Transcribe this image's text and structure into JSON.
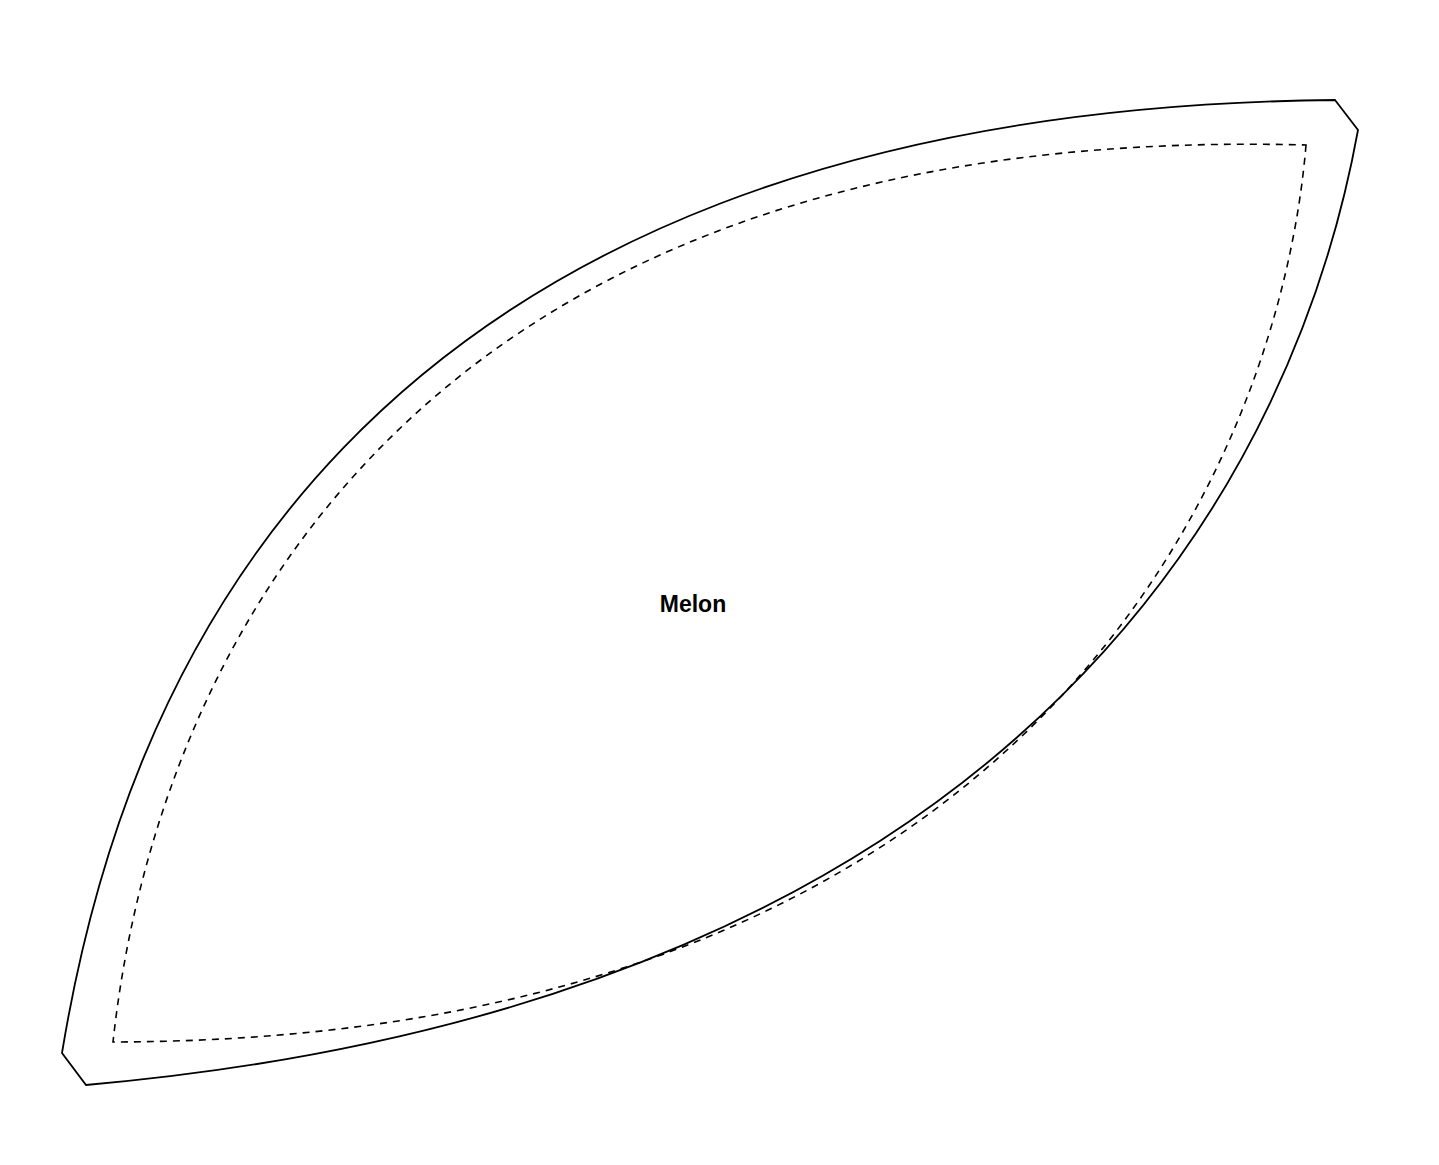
{
  "template": {
    "label": "Melon",
    "shape": "melon-segment",
    "colors": {
      "background": "#ffffff",
      "outline": "#000000",
      "seam": "#000000"
    },
    "outline": {
      "d": "M 1335 100 L 1358 130 C 1300 450 1050 1000 86 1085 L 62 1053 C 120 700 330 110 1335 100 Z"
    },
    "seam_line": {
      "d": "M 1306 145 C 1280 460 1040 1040 113 1042 C 150 700 370 120 1306 145 Z",
      "dash": "7 6"
    }
  }
}
